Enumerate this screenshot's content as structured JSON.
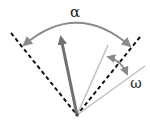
{
  "diagram": {
    "labels": {
      "alpha": "α",
      "omega": "ω"
    },
    "colors": {
      "dashed": "#111111",
      "thick_arrow": "#707070",
      "thin_lines": "#c0c0c0",
      "arcs": "#8a8a8a",
      "text": "#222222"
    },
    "elements": [
      {
        "name": "left-boundary",
        "type": "dashed-line"
      },
      {
        "name": "right-boundary",
        "type": "dashed-line"
      },
      {
        "name": "main-direction",
        "type": "thick-arrow"
      },
      {
        "name": "ray-1",
        "type": "thin-line"
      },
      {
        "name": "ray-2",
        "type": "thin-line"
      },
      {
        "name": "alpha-arc",
        "type": "double-arrow-arc"
      },
      {
        "name": "omega-arc",
        "type": "double-arrow-arc"
      }
    ]
  }
}
